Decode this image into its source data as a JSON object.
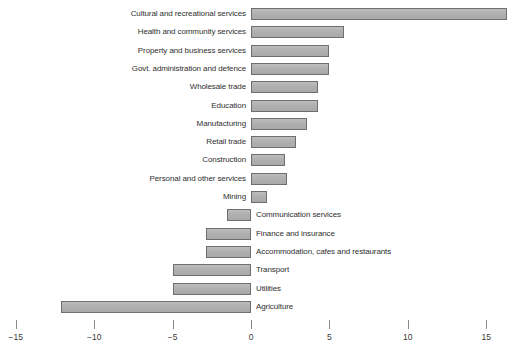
{
  "chart_data": {
    "type": "bar",
    "orientation": "horizontal",
    "title": "",
    "subtitle": "",
    "xlabel": "",
    "ylabel": "",
    "xlim": [
      -15,
      15
    ],
    "ticks": [
      -15,
      -10,
      -5,
      0,
      5,
      10,
      15
    ],
    "tick_labels": [
      "−15",
      "−10",
      "−5",
      "0",
      "5",
      "10",
      "15"
    ],
    "grid": false,
    "legend": "none",
    "bar_fill": "#b3b3b3",
    "bar_border": "#6e6e6e",
    "background": "#ffffff",
    "categories": [
      "Cultural and recreational services",
      "Health and community services",
      "Property and business services",
      "Govt. administration and defence",
      "Wholesale trade",
      "Education",
      "Manufacturing",
      "Retail trade",
      "Construction",
      "Personal and other services",
      "Mining",
      "Communication services",
      "Finance and insurance",
      "Accommodation, cafes and restaurants",
      "Transport",
      "Utilities",
      "Agriculture"
    ],
    "values": [
      16.3,
      5.9,
      5.0,
      5.0,
      4.3,
      4.3,
      3.6,
      2.9,
      2.2,
      2.3,
      1.0,
      -1.5,
      -2.9,
      -2.9,
      -5.0,
      -5.0,
      -12.1
    ]
  }
}
